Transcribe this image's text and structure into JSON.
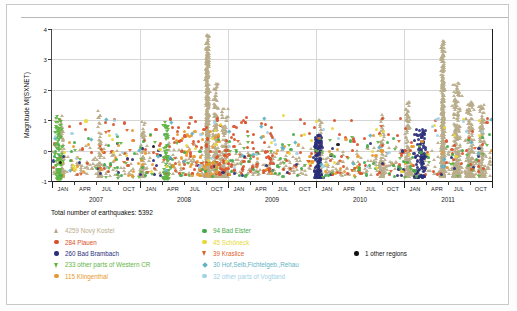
{
  "chart_data": {
    "type": "scatter",
    "title": "",
    "xlabel": "",
    "ylabel": "Magnitude Ml(SXNET)",
    "ylim": [
      -1,
      4
    ],
    "yticks": [
      -1,
      0,
      1,
      2,
      3,
      4
    ],
    "ytick_labels": [
      "-1",
      "0",
      "1",
      "2",
      "3",
      "4"
    ],
    "xlim": [
      "2007-01",
      "2011-12"
    ],
    "xtick_labels": [
      "JAN",
      "APR",
      "JUL",
      "OCT",
      "JAN",
      "APR",
      "JUL",
      "OCT",
      "JAN",
      "APR",
      "JUL",
      "OCT",
      "JAN",
      "APR",
      "JUL",
      "OCT",
      "JAN",
      "APR",
      "JUL",
      "OCT"
    ],
    "year_labels": [
      "2007",
      "2008",
      "2009",
      "2010",
      "2011"
    ],
    "grid": true,
    "legend_position": "below",
    "total_label": "Total number of earthquakes: 5392",
    "total_count": 5392,
    "series": [
      {
        "name": "4259 Nový Kostel",
        "count": 4259,
        "label": "4259 Nový Kostel",
        "marker": "triangle-up",
        "color": "#b9ac8a"
      },
      {
        "name": "284 Plauen",
        "count": 284,
        "label": "284 Plauen",
        "marker": "circle",
        "color": "#d94f29"
      },
      {
        "name": "260 Bad Brambach",
        "count": 260,
        "label": "260 Bad Brambach",
        "marker": "circle",
        "color": "#2b2f7a"
      },
      {
        "name": "233 other parts of Western CR",
        "count": 233,
        "label": "233 other parts of Western CR",
        "marker": "triangle-down",
        "color": "#62b544"
      },
      {
        "name": "115 Klingenthal",
        "count": 115,
        "label": "115 Klingenthal",
        "marker": "circle",
        "color": "#e8992b"
      },
      {
        "name": "94 Bad Elster",
        "count": 94,
        "label": "94 Bad Elster",
        "marker": "circle",
        "color": "#3faa48"
      },
      {
        "name": "45 Schöneck",
        "count": 45,
        "label": "45 Schöneck",
        "marker": "circle",
        "color": "#e8d837"
      },
      {
        "name": "39 Kraslice",
        "count": 39,
        "label": "39 Kraslice",
        "marker": "triangle-down",
        "color": "#e0622b"
      },
      {
        "name": "30 Hof,Selb,Fichtelgeb.,Rehau",
        "count": 30,
        "label": "30 Hof,Selb,Fichtelgeb.,Rehau",
        "marker": "diamond",
        "color": "#5fb3c4"
      },
      {
        "name": "32 other parts of Vogtland",
        "count": 32,
        "label": "32 other parts of Vogtland",
        "marker": "circle",
        "color": "#9fd2e6"
      },
      {
        "name": "1 other regions",
        "count": 1,
        "label": "1 other regions",
        "marker": "circle",
        "color": "#111111"
      }
    ]
  },
  "figure": {
    "y_axis_label": "Magnitude Ml(SXNET)"
  }
}
